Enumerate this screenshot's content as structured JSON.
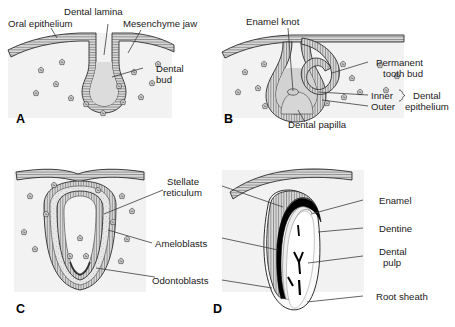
{
  "figure": {
    "title_visible": "",
    "colors": {
      "ink": "#1a1a1a",
      "epithelium_fill": "#d8d8d8",
      "mesenchyme_fill": "#efefef",
      "papilla_fill": "#d0d0d0",
      "stellate_fill": "#e4e4e4",
      "enamel_black": "#000000",
      "pulp_white": "#ffffff",
      "leader_line": "#3c3c3c"
    }
  },
  "panels": [
    {
      "letter": "A",
      "name": "bud-stage",
      "labels": [
        {
          "id": "oral-epithelium",
          "text": "Oral epithelium"
        },
        {
          "id": "dental-lamina",
          "text": "Dental lamina"
        },
        {
          "id": "mesenchyme-jaw",
          "text": "Mesenchyme jaw"
        },
        {
          "id": "dental-bud",
          "text": "Dental\nbud"
        }
      ]
    },
    {
      "letter": "B",
      "name": "cap-stage",
      "labels": [
        {
          "id": "enamel-knot",
          "text": "Enamel knot"
        },
        {
          "id": "permanent-tooth-bud",
          "text": "Permanent\ntooth bud"
        },
        {
          "id": "inner",
          "text": "Inner"
        },
        {
          "id": "outer",
          "text": "Outer"
        },
        {
          "id": "dental-epithelium",
          "text": "Dental\nepithelium"
        },
        {
          "id": "dental-papilla",
          "text": "Dental papilla"
        }
      ]
    },
    {
      "letter": "C",
      "name": "bell-stage",
      "labels": [
        {
          "id": "stellate-reticulum",
          "text": "Stellate\nreticulum"
        },
        {
          "id": "ameloblasts",
          "text": "Ameloblasts"
        },
        {
          "id": "odontoblasts",
          "text": "Odontoblasts"
        }
      ]
    },
    {
      "letter": "D",
      "name": "crown-formation-stage",
      "labels": [
        {
          "id": "enamel",
          "text": "Enamel"
        },
        {
          "id": "dentine",
          "text": "Dentine"
        },
        {
          "id": "dental-pulp",
          "text": "Dental\npulp"
        },
        {
          "id": "root-sheath",
          "text": "Root sheath"
        }
      ]
    }
  ],
  "label_text": {
    "oral_epithelium": "Oral epithelium",
    "dental_lamina": "Dental lamina",
    "mesenchyme_jaw": "Mesenchyme jaw",
    "dental_bud_l1": "Dental",
    "dental_bud_l2": "bud",
    "enamel_knot": "Enamel knot",
    "permanent_tooth_bud_l1": "Permanent",
    "permanent_tooth_bud_l2": "tooth bud",
    "inner": "Inner",
    "outer": "Outer",
    "dental_epithelium_l1": "Dental",
    "dental_epithelium_l2": "epithelium",
    "dental_papilla": "Dental papilla",
    "stellate_reticulum_l1": "Stellate",
    "stellate_reticulum_l2": "reticulum",
    "ameloblasts": "Ameloblasts",
    "odontoblasts": "Odontoblasts",
    "enamel": "Enamel",
    "dentine": "Dentine",
    "dental_pulp_l1": "Dental",
    "dental_pulp_l2": "pulp",
    "root_sheath": "Root sheath",
    "letter_a": "A",
    "letter_b": "B",
    "letter_c": "C",
    "letter_d": "D"
  }
}
